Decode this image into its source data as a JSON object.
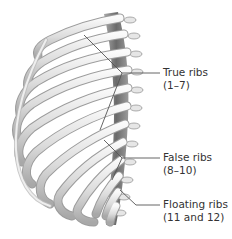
{
  "figure": {
    "colors": {
      "bone_light": "#f2f2f2",
      "bone_mid": "#c8c8c8",
      "bone_dark": "#6e6e6e",
      "leader_line": "#555555",
      "label_text": "#333333"
    }
  },
  "labels": [
    {
      "id": "true-ribs",
      "line1": "True ribs",
      "line2": "(1–7)"
    },
    {
      "id": "false-ribs",
      "line1": "False ribs",
      "line2": "(8–10)"
    },
    {
      "id": "floating-ribs",
      "line1": "Floating ribs",
      "line2": "(11 and 12)"
    }
  ]
}
